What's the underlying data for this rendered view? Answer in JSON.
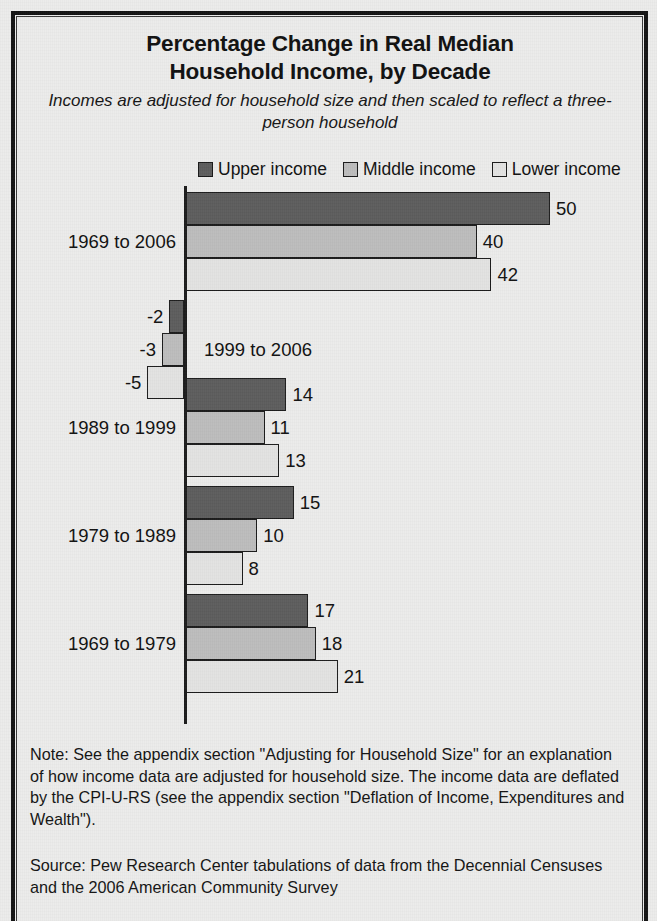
{
  "figure": {
    "title_line1": "Percentage Change in Real Median",
    "title_line2": "Household Income, by Decade",
    "subtitle": "Incomes are adjusted for household size and then scaled to reflect a three-person household",
    "note": "Note: See the appendix section \"Adjusting for Household Size\" for an explanation of how income data are adjusted for household size. The income data are deflated by the CPI-U-RS (see the appendix section \"Deflation of Income, Expenditures and Wealth\").",
    "source": "Source: Pew Research Center tabulations of data from the Decennial Censuses and the 2006 American Community Survey"
  },
  "legend": {
    "items": [
      {
        "label": "Upper income",
        "color": "#5d5d5d",
        "swatch": "legend-swatch-upper"
      },
      {
        "label": "Middle income",
        "color": "#bdbdbd",
        "swatch": "legend-swatch-middle"
      },
      {
        "label": "Lower income",
        "color": "#e3e3e2",
        "swatch": "legend-swatch-lower"
      }
    ]
  },
  "chart_data": {
    "type": "bar",
    "orientation": "horizontal",
    "title": "Percentage Change in Real Median Household Income, by Decade",
    "subtitle": "Incomes are adjusted for household size and then scaled to reflect a three-person household",
    "xlabel": "",
    "ylabel": "",
    "xlim": [
      -6,
      52
    ],
    "grid": false,
    "legend_position": "top-center",
    "categories": [
      "1969 to 2006",
      "1999 to 2006",
      "1989 to 1999",
      "1979 to 1989",
      "1969 to 1979"
    ],
    "series": [
      {
        "name": "Upper income",
        "color": "#5d5d5d",
        "values": [
          50,
          -2,
          14,
          15,
          17
        ]
      },
      {
        "name": "Middle income",
        "color": "#bdbdbd",
        "values": [
          40,
          -3,
          11,
          10,
          18
        ]
      },
      {
        "name": "Lower income",
        "color": "#e3e3e2",
        "values": [
          42,
          -5,
          13,
          8,
          21
        ]
      }
    ],
    "data_labels": [
      {
        "category": "1969 to 2006",
        "Upper income": "50",
        "Middle income": "40",
        "Lower income": "42"
      },
      {
        "category": "1999 to 2006",
        "Upper income": "-2",
        "Middle income": "-3",
        "Lower income": "-5"
      },
      {
        "category": "1989 to 1999",
        "Upper income": "14",
        "Middle income": "11",
        "Lower income": "13"
      },
      {
        "category": "1979 to 1989",
        "Upper income": "15",
        "Middle income": "10",
        "Lower income": "8"
      },
      {
        "category": "1969 to 1979",
        "Upper income": "17",
        "Middle income": "18",
        "Lower income": "21"
      }
    ],
    "category_label_placement": [
      "outside-left",
      "inside-plot",
      "outside-left",
      "outside-left",
      "outside-left"
    ]
  }
}
